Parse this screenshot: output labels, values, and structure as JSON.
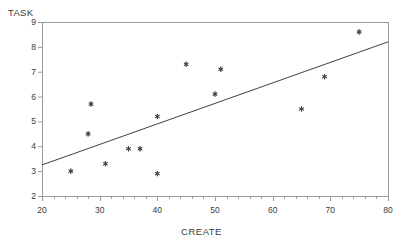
{
  "chart_data": {
    "type": "scatter",
    "title": "",
    "xlabel": "CREATE",
    "ylabel": "TASK",
    "xlim": [
      20,
      80
    ],
    "ylim": [
      2,
      9
    ],
    "xticks": [
      20,
      30,
      40,
      50,
      60,
      70,
      80
    ],
    "yticks": [
      2,
      3,
      4,
      5,
      6,
      7,
      8,
      9
    ],
    "x_minor_tick_step": 2,
    "grid": false,
    "legend": null,
    "marker": "asterisk",
    "marker_color": "#404040",
    "line_color": "#404040",
    "frame_color": "#9a9a9a",
    "background": "#ffffff",
    "points": [
      {
        "x": 25,
        "y": 3.0
      },
      {
        "x": 28,
        "y": 4.5
      },
      {
        "x": 28.5,
        "y": 5.7
      },
      {
        "x": 31,
        "y": 3.3
      },
      {
        "x": 35,
        "y": 3.9
      },
      {
        "x": 37,
        "y": 3.9
      },
      {
        "x": 40,
        "y": 2.9
      },
      {
        "x": 40,
        "y": 5.2
      },
      {
        "x": 45,
        "y": 7.3
      },
      {
        "x": 50,
        "y": 6.1
      },
      {
        "x": 51,
        "y": 7.1
      },
      {
        "x": 65,
        "y": 5.5
      },
      {
        "x": 69,
        "y": 6.8
      },
      {
        "x": 75,
        "y": 8.6
      }
    ],
    "fit_line": {
      "type": "linear-regression",
      "x_start": 20,
      "y_start": 3.25,
      "x_end": 80,
      "y_end": 8.2
    }
  },
  "plot": {
    "x_axis_title": "CREATE",
    "y_axis_title": "TASK"
  }
}
